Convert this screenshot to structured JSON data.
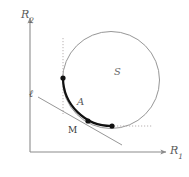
{
  "figure": {
    "kind": "mathematical-diagram",
    "background_color": "#ffffff",
    "axes": {
      "x_label": "R",
      "x_subscript": "1",
      "y_label": "R",
      "y_subscript": "2",
      "color": "#8c8c8c",
      "origin": {
        "x": 30,
        "y": 152
      },
      "x_axis_end": {
        "x": 168,
        "y": 152
      },
      "y_axis_end": {
        "x": 30,
        "y": 16
      }
    },
    "labels": {
      "set_label": "S",
      "arc_label": "A",
      "point_label": "M",
      "line_label": "ℓ"
    },
    "circle": {
      "name": "S",
      "center_x": 111,
      "center_y": 80,
      "radius": 48.5,
      "stroke": "#8a8a8a",
      "stroke_width": 0.9,
      "fill": "none"
    },
    "arc": {
      "name": "A",
      "stroke": "#111111",
      "stroke_width": 2.2,
      "start_point": {
        "x": 63,
        "y": 78
      },
      "end_point": {
        "x": 112,
        "y": 126
      }
    },
    "tangent_line": {
      "name": "ℓ",
      "stroke": "#8a8a8a",
      "stroke_width": 0.9,
      "from": {
        "x": 38,
        "y": 97
      },
      "to": {
        "x": 122,
        "y": 145
      }
    },
    "dotted_guides": [
      {
        "name": "vertical-guide",
        "x1": 63,
        "y1": 38,
        "x2": 63,
        "y2": 114,
        "stroke": "#b0a8a8"
      },
      {
        "name": "horizontal-guide",
        "x1": 114,
        "y1": 126,
        "x2": 152,
        "y2": 126,
        "stroke": "#b0a8a8"
      }
    ],
    "points": [
      {
        "name": "arc-start-point",
        "x": 63,
        "y": 78,
        "r": 2.6,
        "fill": "#111111"
      },
      {
        "name": "point-m",
        "x": 88,
        "y": 121,
        "r": 2.6,
        "fill": "#111111"
      },
      {
        "name": "arc-end-point",
        "x": 112,
        "y": 126,
        "r": 2.6,
        "fill": "#111111"
      }
    ]
  }
}
